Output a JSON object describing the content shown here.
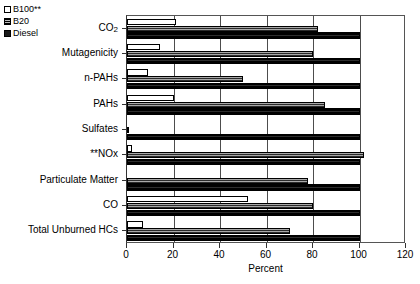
{
  "chart_data": {
    "type": "bar",
    "orientation": "horizontal",
    "title": "",
    "xlabel": "Percent",
    "ylabel": "",
    "xlim": [
      0,
      120
    ],
    "xticks": [
      0,
      20,
      40,
      60,
      80,
      100,
      120
    ],
    "grid": "vertical",
    "legend_position": "top-left",
    "categories": [
      "CO₂",
      "Mutagenicity",
      "n-PAHs",
      "PAHs",
      "Sulfates",
      "**NOx",
      "Particulate Matter",
      "CO",
      "Total Unburned HCs"
    ],
    "series": [
      {
        "name": "B100**",
        "color": "#ffffff",
        "pattern": "empty",
        "values": [
          21,
          14,
          9,
          20,
          0,
          2,
          0,
          52,
          7
        ]
      },
      {
        "name": "B20",
        "color": "#7a7a7a",
        "pattern": "hatched",
        "values": [
          82,
          80,
          50,
          85,
          1,
          102,
          78,
          80,
          70
        ]
      },
      {
        "name": "Diesel",
        "color": "#161616",
        "pattern": "solid",
        "values": [
          100,
          100,
          100,
          100,
          100,
          100,
          100,
          100,
          100
        ]
      }
    ]
  },
  "legend": {
    "items": [
      {
        "label": "B100**",
        "swatch": "legend-swatch-empty"
      },
      {
        "label": "B20",
        "swatch": "legend-swatch-hatched"
      },
      {
        "label": "Diesel",
        "swatch": "legend-swatch-solid"
      }
    ]
  },
  "axis": {
    "x_title": "Percent",
    "x_tick_labels": [
      "0",
      "20",
      "40",
      "60",
      "80",
      "100",
      "120"
    ]
  },
  "category_labels": {
    "co2_main": "CO",
    "co2_sub": "2",
    "mutagenicity": "Mutagenicity",
    "n_pahs": "n-PAHs",
    "pahs": "PAHs",
    "sulfates": "Sulfates",
    "nox": "**NOx",
    "particulate_matter": "Particulate Matter",
    "co": "CO",
    "total_unburned_hcs": "Total Unburned HCs"
  },
  "colors": {
    "series_b100": "#ffffff",
    "series_b20": "#7a7a7a",
    "series_diesel": "#161616",
    "axis": "#333333",
    "grid": "#4d4d4d",
    "background": "#ffffff"
  }
}
